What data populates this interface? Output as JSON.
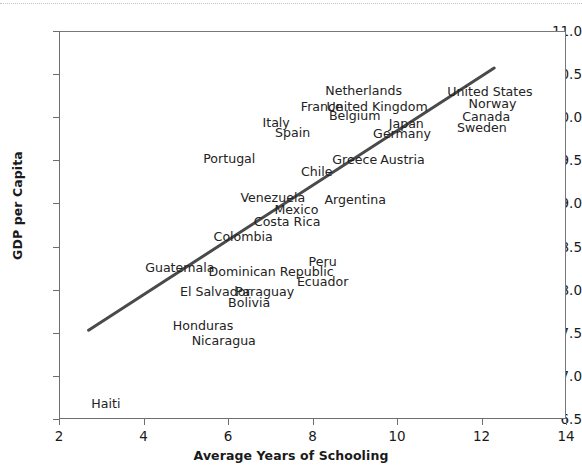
{
  "figure": {
    "background": "#ffffff",
    "frame_color": "#6e6e6e",
    "text_color": "#232323"
  },
  "axes": {
    "x_title": "Average Years of Schooling",
    "y_title": "GDP per Capita",
    "x_ticks": [
      "2",
      "4",
      "6",
      "8",
      "10",
      "12",
      "14"
    ],
    "y_ticks": [
      "11.0",
      "10.5",
      "10.0",
      "9.5",
      "9.0",
      "8.5",
      "8.0",
      "7.5",
      "7.0",
      "6.5"
    ]
  },
  "chart_data": {
    "type": "scatter",
    "title": "",
    "xlabel": "Average Years of Schooling",
    "ylabel": "GDP per Capita",
    "xlim": [
      2,
      14
    ],
    "ylim": [
      6.5,
      11.0
    ],
    "xticks": [
      2,
      4,
      6,
      8,
      10,
      12,
      14
    ],
    "yticks": [
      6.5,
      7.0,
      7.5,
      8.0,
      8.5,
      9.0,
      9.5,
      10.0,
      10.5,
      11.0
    ],
    "grid": false,
    "legend": "none",
    "marker_style": "text-label-only",
    "annotation_note": "Each country is plotted as a text label rather than a marker symbol.",
    "trendline": {
      "type": "linear",
      "color": "#4a4a4a",
      "width": 3,
      "x_start": 2.7,
      "y_start": 7.53,
      "x_end": 12.3,
      "y_end": 10.57
    },
    "points": [
      {
        "label": "Netherlands",
        "x": 9.21,
        "y": 10.3
      },
      {
        "label": "United States",
        "x": 12.2,
        "y": 10.29
      },
      {
        "label": "Norway",
        "x": 12.26,
        "y": 10.15
      },
      {
        "label": "France",
        "x": 8.22,
        "y": 10.12
      },
      {
        "label": "United Kingdom",
        "x": 9.53,
        "y": 10.12
      },
      {
        "label": "Canada",
        "x": 12.11,
        "y": 10.0
      },
      {
        "label": "Belgium",
        "x": 9.0,
        "y": 10.01
      },
      {
        "label": "Italy",
        "x": 7.14,
        "y": 9.93
      },
      {
        "label": "Japan",
        "x": 10.22,
        "y": 9.92
      },
      {
        "label": "Sweden",
        "x": 12.01,
        "y": 9.88
      },
      {
        "label": "Spain",
        "x": 7.53,
        "y": 9.82
      },
      {
        "label": "Germany",
        "x": 10.12,
        "y": 9.81
      },
      {
        "label": "Portugal",
        "x": 6.03,
        "y": 9.52
      },
      {
        "label": "Greece",
        "x": 9.0,
        "y": 9.5
      },
      {
        "label": "Austria",
        "x": 10.13,
        "y": 9.5
      },
      {
        "label": "Chile",
        "x": 8.1,
        "y": 9.36
      },
      {
        "label": "Venezuela",
        "x": 7.06,
        "y": 9.06
      },
      {
        "label": "Argentina",
        "x": 9.01,
        "y": 9.04
      },
      {
        "label": "Mexico",
        "x": 7.62,
        "y": 8.92
      },
      {
        "label": "Costa Rica",
        "x": 7.4,
        "y": 8.79
      },
      {
        "label": "Colombia",
        "x": 6.36,
        "y": 8.61
      },
      {
        "label": "Peru",
        "x": 8.24,
        "y": 8.32
      },
      {
        "label": "Guatemala",
        "x": 4.86,
        "y": 8.25
      },
      {
        "label": "Dominican Republic",
        "x": 7.02,
        "y": 8.21
      },
      {
        "label": "Ecuador",
        "x": 8.24,
        "y": 8.09
      },
      {
        "label": "El Salvador",
        "x": 5.7,
        "y": 7.97
      },
      {
        "label": "Paraguay",
        "x": 6.87,
        "y": 7.97
      },
      {
        "label": "Bolivia",
        "x": 6.5,
        "y": 7.84
      },
      {
        "label": "Honduras",
        "x": 5.41,
        "y": 7.58
      },
      {
        "label": "Nicaragua",
        "x": 5.9,
        "y": 7.41
      },
      {
        "label": "Haiti",
        "x": 3.11,
        "y": 6.67
      }
    ]
  }
}
